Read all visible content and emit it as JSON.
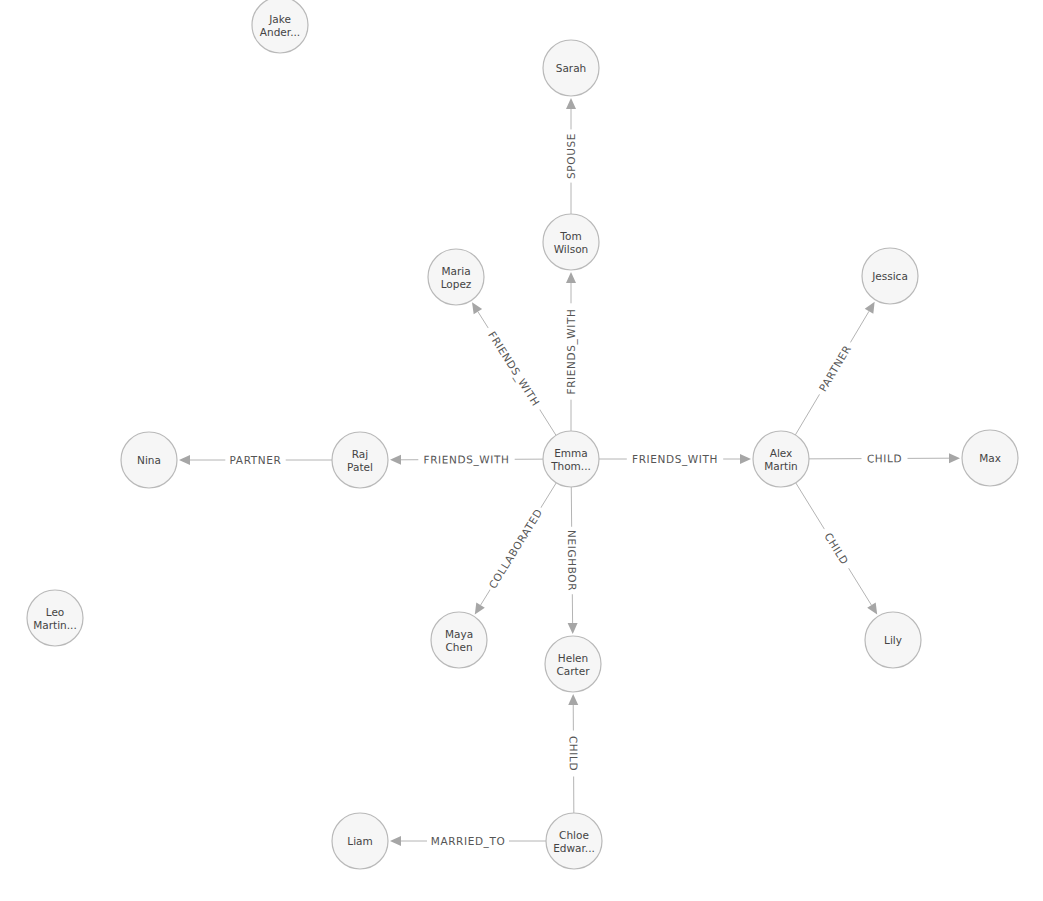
{
  "graph": {
    "style": {
      "node_radius": 28,
      "node_fill": "#f6f6f6",
      "node_stroke": "#b9b9b9",
      "edge_color": "#b4b4b4",
      "arrow_color": "#a6a6a6",
      "label_color": "#555555",
      "node_text_color": "#444444"
    },
    "nodes": [
      {
        "id": "emma",
        "lines": [
          "Emma",
          "Thom..."
        ],
        "x": 571,
        "y": 459
      },
      {
        "id": "sarah",
        "lines": [
          "Sarah"
        ],
        "x": 571,
        "y": 68
      },
      {
        "id": "tom",
        "lines": [
          "Tom",
          "Wilson"
        ],
        "x": 571,
        "y": 242
      },
      {
        "id": "maria",
        "lines": [
          "Maria",
          "Lopez"
        ],
        "x": 456,
        "y": 277
      },
      {
        "id": "jake",
        "lines": [
          "Jake",
          "Ander..."
        ],
        "x": 280,
        "y": 25
      },
      {
        "id": "raj",
        "lines": [
          "Raj",
          "Patel"
        ],
        "x": 360,
        "y": 460
      },
      {
        "id": "nina",
        "lines": [
          "Nina"
        ],
        "x": 149,
        "y": 460
      },
      {
        "id": "alex",
        "lines": [
          "Alex",
          "Martin"
        ],
        "x": 781,
        "y": 459
      },
      {
        "id": "jessica",
        "lines": [
          "Jessica"
        ],
        "x": 890,
        "y": 276
      },
      {
        "id": "max",
        "lines": [
          "Max"
        ],
        "x": 990,
        "y": 458
      },
      {
        "id": "lily",
        "lines": [
          "Lily"
        ],
        "x": 893,
        "y": 640
      },
      {
        "id": "maya",
        "lines": [
          "Maya",
          "Chen"
        ],
        "x": 459,
        "y": 640
      },
      {
        "id": "helen",
        "lines": [
          "Helen",
          "Carter"
        ],
        "x": 573,
        "y": 664
      },
      {
        "id": "leo",
        "lines": [
          "Leo",
          "Martin..."
        ],
        "x": 55,
        "y": 618
      },
      {
        "id": "chloe",
        "lines": [
          "Chloe",
          "Edwar..."
        ],
        "x": 574,
        "y": 841
      },
      {
        "id": "liam",
        "lines": [
          "Liam"
        ],
        "x": 360,
        "y": 841
      }
    ],
    "edges": [
      {
        "source": "tom",
        "target": "sarah",
        "label": "SPOUSE"
      },
      {
        "source": "emma",
        "target": "tom",
        "label": "FRIENDS_WITH"
      },
      {
        "source": "emma",
        "target": "maria",
        "label": "FRIENDS_WITH"
      },
      {
        "source": "emma",
        "target": "raj",
        "label": "FRIENDS_WITH"
      },
      {
        "source": "raj",
        "target": "nina",
        "label": "PARTNER"
      },
      {
        "source": "emma",
        "target": "alex",
        "label": "FRIENDS_WITH"
      },
      {
        "source": "alex",
        "target": "jessica",
        "label": "PARTNER"
      },
      {
        "source": "alex",
        "target": "max",
        "label": "CHILD"
      },
      {
        "source": "alex",
        "target": "lily",
        "label": "CHILD"
      },
      {
        "source": "emma",
        "target": "maya",
        "label": "COLLABORATED"
      },
      {
        "source": "emma",
        "target": "helen",
        "label": "NEIGHBOR"
      },
      {
        "source": "chloe",
        "target": "helen",
        "label": "CHILD"
      },
      {
        "source": "chloe",
        "target": "liam",
        "label": "MARRIED_TO"
      }
    ]
  }
}
